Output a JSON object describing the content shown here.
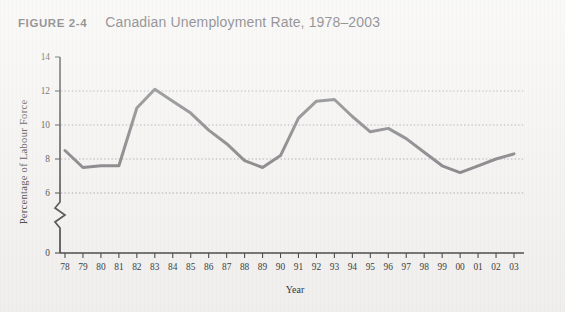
{
  "figure": {
    "number_label": "FIGURE 2-4",
    "title": "Canadian Unemployment Rate, 1978–2003"
  },
  "colors": {
    "page_background": "#f4f3f1",
    "line": "#6e6e72",
    "axis": "#3c3c3f",
    "gridline": "#9a9ba4",
    "text": "#2f2f32"
  },
  "chart_data": {
    "type": "line",
    "title": "Canadian Unemployment Rate, 1978–2003",
    "xlabel": "Year",
    "ylabel": "Percentage of Labour Force",
    "categories": [
      "78",
      "79",
      "80",
      "81",
      "82",
      "83",
      "84",
      "85",
      "86",
      "87",
      "88",
      "89",
      "90",
      "91",
      "92",
      "93",
      "94",
      "95",
      "96",
      "97",
      "98",
      "99",
      "00",
      "01",
      "02",
      "03"
    ],
    "values": [
      8.5,
      7.5,
      7.6,
      7.6,
      11.0,
      12.1,
      11.4,
      10.7,
      9.7,
      8.9,
      7.9,
      7.5,
      8.2,
      10.4,
      11.4,
      11.5,
      10.5,
      9.6,
      9.8,
      9.2,
      8.4,
      7.6,
      7.2,
      7.6,
      8.0,
      8.3
    ],
    "x": [
      1978,
      1979,
      1980,
      1981,
      1982,
      1983,
      1984,
      1985,
      1986,
      1987,
      1988,
      1989,
      1990,
      1991,
      1992,
      1993,
      1994,
      1995,
      1996,
      1997,
      1998,
      1999,
      2000,
      2001,
      2002,
      2003
    ],
    "ytick_labels": [
      "0",
      "6",
      "8",
      "10",
      "12",
      "14"
    ],
    "ytick_values": [
      0,
      6,
      8,
      10,
      12,
      14
    ],
    "ylim": [
      6,
      14
    ],
    "y_axis_break": true,
    "y_axis_break_note": "axis broken between 0 and 6",
    "grid": "horizontal dotted gridlines at 6, 8, 10, 12",
    "legend": "none",
    "series": [
      {
        "name": "Unemployment rate",
        "values": [
          8.5,
          7.5,
          7.6,
          7.6,
          11.0,
          12.1,
          11.4,
          10.7,
          9.7,
          8.9,
          7.9,
          7.5,
          8.2,
          10.4,
          11.4,
          11.5,
          10.5,
          9.6,
          9.8,
          9.2,
          8.4,
          7.6,
          7.2,
          7.6,
          8.0,
          8.3
        ]
      }
    ]
  }
}
